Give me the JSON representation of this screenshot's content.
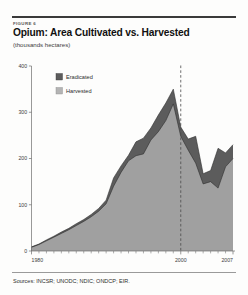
{
  "figure": {
    "label": "FIGURE 6",
    "title": "Opium: Area Cultivated vs. Harvested",
    "subtitle": "(thousands hectares)",
    "sources": "Sources: INCSR; UNODC; NDIC; ONDCP; EIR."
  },
  "colors": {
    "eradicated": "#5c5c5c",
    "harvested": "#a0a0a0",
    "axis": "#6d6d6d",
    "marker": "#4a4a4a",
    "rule": "#3a3a3a"
  },
  "chart_data": {
    "type": "area",
    "title": "Opium: Area Cultivated vs. Harvested",
    "subtitle": "(thousands hectares)",
    "xlabel": "",
    "ylabel": "thousands hectares",
    "ylim": [
      0,
      400
    ],
    "xlim": [
      1980,
      2007
    ],
    "yticks": [
      0,
      100,
      200,
      300,
      400
    ],
    "ytick_labels": [
      "0",
      "100",
      "200",
      "300",
      "400"
    ],
    "xticks": [
      1980,
      2000,
      2007
    ],
    "xtick_labels": [
      "1980",
      "2000",
      "2007"
    ],
    "grid": false,
    "stacked": true,
    "legend_position": "upper-left-inside",
    "annotations": [
      {
        "type": "vline",
        "x": 2000,
        "style": "dashed",
        "label": ""
      }
    ],
    "x": [
      1980,
      1981,
      1982,
      1983,
      1984,
      1985,
      1986,
      1987,
      1988,
      1989,
      1990,
      1991,
      1992,
      1993,
      1994,
      1995,
      1996,
      1997,
      1998,
      1999,
      2000,
      2001,
      2002,
      2003,
      2004,
      2005,
      2006,
      2007
    ],
    "series": [
      {
        "name": "Harvested",
        "color": "#a0a0a0",
        "values": [
          8,
          14,
          22,
          30,
          38,
          46,
          55,
          64,
          74,
          86,
          102,
          140,
          170,
          195,
          206,
          210,
          240,
          258,
          282,
          318,
          248,
          218,
          190,
          145,
          150,
          136,
          182,
          200
        ]
      },
      {
        "name": "Eradicated",
        "color": "#5c5c5c",
        "values": [
          1,
          1,
          2,
          2,
          3,
          3,
          4,
          4,
          5,
          6,
          8,
          18,
          14,
          12,
          30,
          34,
          26,
          36,
          38,
          32,
          20,
          24,
          58,
          22,
          24,
          86,
          30,
          30
        ]
      }
    ],
    "totals_note": "Upper boundary = total area cultivated (harvested + eradicated)"
  },
  "legend": {
    "items": [
      {
        "label": "Eradicated",
        "swatch": "dark"
      },
      {
        "label": "Harvested",
        "swatch": "light"
      }
    ]
  }
}
